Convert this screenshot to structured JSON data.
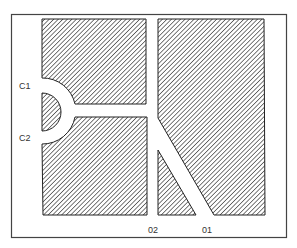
{
  "diagram": {
    "type": "plan-view-layout",
    "frame": {
      "x": 11,
      "y": 14,
      "width": 276,
      "height": 224
    },
    "colors": {
      "stroke": "#222222",
      "hatch": "#333333",
      "background": "#ffffff",
      "label": "#333333"
    },
    "labels": {
      "c1": "C1",
      "c2": "C2",
      "o2": "02",
      "o1": "01"
    },
    "regions": [
      {
        "id": "top-left-block",
        "shape": "rect-with-arc-cutout"
      },
      {
        "id": "bottom-left-block",
        "shape": "rect-with-arc-cutout"
      },
      {
        "id": "semicircle-core",
        "shape": "half-disk"
      },
      {
        "id": "right-block",
        "shape": "polygon"
      },
      {
        "id": "bottom-triangle",
        "shape": "triangle"
      }
    ],
    "channels": [
      {
        "id": "horizontal-channel",
        "connects": [
          "C1/C2 ring",
          "vertical-channel"
        ]
      },
      {
        "id": "vertical-channel",
        "connects": [
          "top",
          "diagonal"
        ]
      },
      {
        "id": "diagonal-channel",
        "exit": "01"
      },
      {
        "id": "vertical-channel-lower",
        "exit": "02"
      }
    ]
  }
}
